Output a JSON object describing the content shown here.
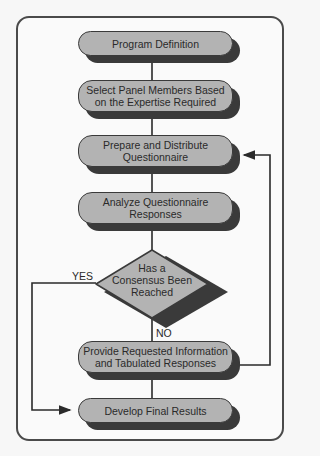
{
  "diagram": {
    "type": "flowchart",
    "colors": {
      "node_fill": "#b3b3b3",
      "node_shadow": "#3a3a3a",
      "line": "#2a2a2a",
      "frame_border": "#4a4a4a",
      "background": "#fafafa"
    },
    "nodes": [
      {
        "id": "program-definition",
        "shape": "rounded-rect",
        "text": "Program Definition"
      },
      {
        "id": "select-panel",
        "shape": "rounded-rect",
        "text_lines": [
          "Select Panel Members Based",
          "on the Expertise Required"
        ]
      },
      {
        "id": "prepare-distribute",
        "shape": "rounded-rect",
        "text_lines": [
          "Prepare and Distribute",
          "Questionnaire"
        ]
      },
      {
        "id": "analyze-responses",
        "shape": "rounded-rect",
        "text_lines": [
          "Analyze Questionnaire",
          "Responses"
        ]
      },
      {
        "id": "consensus-decision",
        "shape": "diamond",
        "text_lines": [
          "Has a",
          "Consensus Been",
          "Reached"
        ]
      },
      {
        "id": "provide-info",
        "shape": "rounded-rect",
        "text_lines": [
          "Provide Requested Information",
          "and Tabulated Responses"
        ]
      },
      {
        "id": "develop-results",
        "shape": "rounded-rect",
        "text": "Develop Final Results"
      }
    ],
    "edges": [
      {
        "from": "program-definition",
        "to": "select-panel"
      },
      {
        "from": "select-panel",
        "to": "prepare-distribute"
      },
      {
        "from": "prepare-distribute",
        "to": "analyze-responses"
      },
      {
        "from": "analyze-responses",
        "to": "consensus-decision"
      },
      {
        "from": "consensus-decision",
        "to": "provide-info",
        "label": "NO"
      },
      {
        "from": "consensus-decision",
        "to": "develop-results",
        "label": "YES"
      },
      {
        "from": "provide-info",
        "to": "prepare-distribute",
        "label": ""
      },
      {
        "from": "provide-info",
        "to": "develop-results"
      }
    ],
    "labels": {
      "yes": "YES",
      "no": "NO"
    }
  }
}
